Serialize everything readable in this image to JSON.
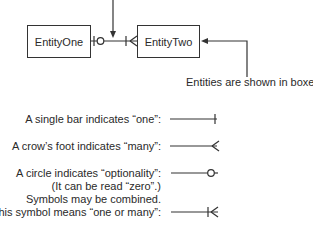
{
  "diagram": {
    "entities": [
      {
        "name": "EntityOne"
      },
      {
        "name": "EntityTwo"
      }
    ],
    "callout": "Entities are shown in boxes.",
    "legend": [
      {
        "label": "A single bar indicates “one”:",
        "symbol": "single-bar"
      },
      {
        "label": "A crow’s foot indicates “many”:",
        "symbol": "crows-foot"
      },
      {
        "label": "A circle indicates “optionality”:",
        "sublabel": "(It can be read “zero”.)",
        "symbol": "circle"
      },
      {
        "label_line1": "Symbols may be combined.",
        "label": "This symbol means “one or many”:",
        "symbol": "bar-crows-foot"
      }
    ],
    "colors": {
      "stroke": "#333333",
      "text": "#2a2a2a",
      "background": "#ffffff"
    }
  }
}
